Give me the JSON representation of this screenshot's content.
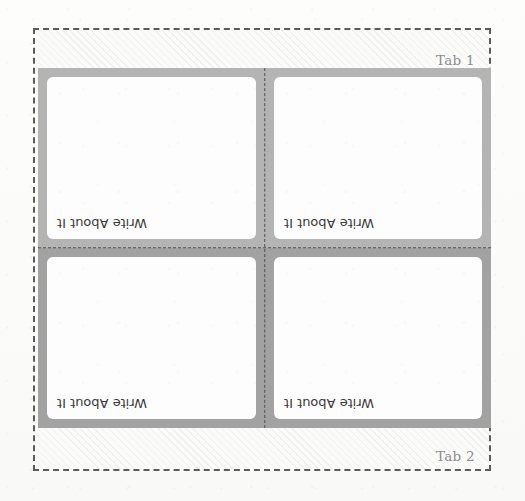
{
  "sheet": {
    "tabs": [
      {
        "label": "Tab 1",
        "position": "top"
      },
      {
        "label": "Tab 2",
        "position": "bottom"
      }
    ],
    "cards": [
      {
        "prompt": "Write About It",
        "row": "top",
        "column": "left"
      },
      {
        "prompt": "Write About It",
        "row": "top",
        "column": "right"
      },
      {
        "prompt": "Write About It",
        "row": "bottom",
        "column": "left"
      },
      {
        "prompt": "Write About It",
        "row": "bottom",
        "column": "right"
      }
    ],
    "colors": {
      "paper": "#fcfcfb",
      "card_fill": "#fdfdfd",
      "gutter_top_row": "#b4b4b4",
      "gutter_bottom_row": "#a2a2a2",
      "dashed_border": "#5b5b5b",
      "fold_guide": "#4f4f4f",
      "tab_label_text": "#8b8b8f",
      "prompt_text": "#3a3a3a"
    }
  }
}
